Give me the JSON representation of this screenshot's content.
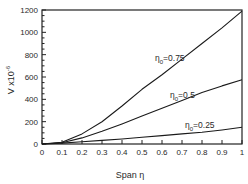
{
  "chart_data": {
    "type": "line",
    "title": "",
    "xlabel": "Span η",
    "ylabel": "V x10⁻⁶",
    "xlim": [
      0,
      1
    ],
    "ylim": [
      0,
      1200
    ],
    "xticks": [
      0,
      0.1,
      0.2,
      0.3,
      0.4,
      0.5,
      0.6,
      0.7,
      0.8,
      0.9,
      1
    ],
    "xtick_labels": [
      "0",
      "0.1",
      "0.2",
      "0.3",
      "0.4",
      "0.5",
      "0.6",
      "0.7",
      "0.8",
      "0.9",
      "1"
    ],
    "yticks": [
      0,
      200,
      400,
      600,
      800,
      1000,
      1200
    ],
    "ytick_labels": [
      "0",
      "200",
      "400",
      "600",
      "800",
      "1000",
      "1200"
    ],
    "grid": false,
    "legend": "inline labels",
    "series": [
      {
        "name": "η₀=0.75",
        "label_main": "η",
        "label_sub": "0",
        "label_rest": "=0.75",
        "x": [
          0,
          0.1,
          0.2,
          0.3,
          0.4,
          0.5,
          0.6,
          0.7,
          0.8,
          0.9,
          1.0
        ],
        "values": [
          0,
          15,
          90,
          200,
          340,
          490,
          620,
          760,
          900,
          1040,
          1190
        ]
      },
      {
        "name": "η₀=0.5",
        "label_main": "η",
        "label_sub": "0",
        "label_rest": "=0.5",
        "x": [
          0,
          0.1,
          0.2,
          0.3,
          0.4,
          0.5,
          0.6,
          0.7,
          0.8,
          0.9,
          1.0
        ],
        "values": [
          0,
          12,
          55,
          115,
          180,
          250,
          320,
          390,
          460,
          520,
          575
        ]
      },
      {
        "name": "η₀=0.25",
        "label_main": "η",
        "label_sub": "0",
        "label_rest": "=0.25",
        "x": [
          0,
          0.1,
          0.2,
          0.3,
          0.4,
          0.5,
          0.6,
          0.7,
          0.8,
          0.9,
          1.0
        ],
        "values": [
          0,
          8,
          20,
          32,
          45,
          60,
          75,
          90,
          105,
          125,
          150
        ]
      }
    ]
  }
}
